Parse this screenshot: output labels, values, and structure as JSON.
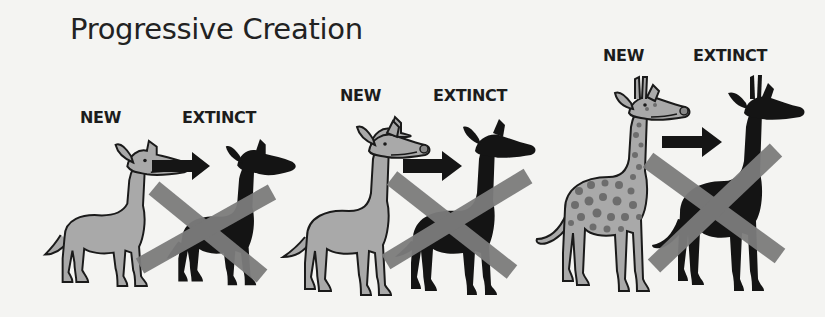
{
  "title": "Progressive Creation",
  "colors": {
    "background": "#f4f4f2",
    "new_animal_fill": "#a9a9a9",
    "outline": "#1a1a1a",
    "silhouette": "#141414",
    "cross": "#7c7c7c",
    "spots": "#6d6d6d"
  },
  "panels": [
    {
      "id": "panel-1",
      "new_label": "NEW",
      "extinct_label": "EXTINCT",
      "new_animal": "short-necked deer",
      "extinct_animal": "deer silhouette (crossed out)"
    },
    {
      "id": "panel-2",
      "new_label": "NEW",
      "extinct_label": "EXTINCT",
      "new_animal": "longer-necked deer",
      "extinct_animal": "deer silhouette (crossed out)"
    },
    {
      "id": "panel-3",
      "new_label": "NEW",
      "extinct_label": "EXTINCT",
      "new_animal": "spotted giraffe-like animal with ossicones",
      "extinct_animal": "giraffe silhouette (crossed out)"
    }
  ]
}
